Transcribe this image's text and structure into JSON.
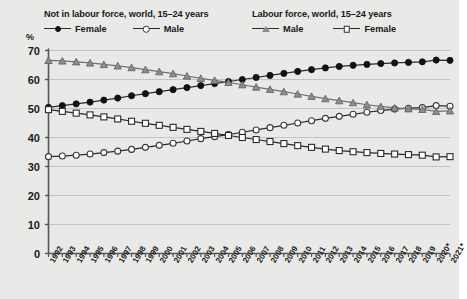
{
  "legend": {
    "left": {
      "title": "Not in labour force, world, 15–24 years",
      "entries": [
        {
          "label": "Female",
          "marker": "circle-filled"
        },
        {
          "label": "Male",
          "marker": "circle-open"
        }
      ]
    },
    "right": {
      "title": "Labour force, world, 15–24 years",
      "entries": [
        {
          "label": "Male",
          "marker": "triangle"
        },
        {
          "label": "Female",
          "marker": "square-open"
        }
      ]
    }
  },
  "axis": {
    "y_unit": "%",
    "y_ticks": [
      0,
      10,
      20,
      30,
      40,
      50,
      60,
      70
    ]
  },
  "chart_data": {
    "type": "line",
    "title": "",
    "xlabel": "",
    "ylabel": "%",
    "ylim": [
      0,
      70
    ],
    "grid": true,
    "legend_position": "top",
    "x": [
      "1992",
      "1993",
      "1994",
      "1995",
      "1996",
      "1997",
      "1998",
      "1999",
      "2000",
      "2001",
      "2002",
      "2003",
      "2004",
      "2005",
      "2006",
      "2007",
      "2008",
      "2009",
      "2010",
      "2011",
      "2012",
      "2013",
      "2014",
      "2015",
      "2016",
      "2017",
      "2018",
      "2019",
      "2020*",
      "2021*"
    ],
    "series": [
      {
        "name": "Female",
        "group": "Not in labour force, world, 15–24 years",
        "marker": "circle-filled",
        "color": "#111111",
        "values": [
          50.4,
          51.0,
          51.6,
          52.2,
          52.9,
          53.6,
          54.4,
          55.1,
          55.8,
          56.5,
          57.2,
          57.9,
          58.6,
          59.3,
          60.0,
          60.7,
          61.4,
          62.1,
          62.8,
          63.4,
          64.0,
          64.5,
          64.9,
          65.2,
          65.5,
          65.7,
          65.9,
          66.1,
          66.7,
          66.6
        ]
      },
      {
        "name": "Male",
        "group": "Not in labour force, world, 15–24 years",
        "marker": "circle-open",
        "color": "#3a3a3a",
        "values": [
          33.4,
          33.6,
          33.9,
          34.3,
          34.8,
          35.3,
          35.9,
          36.6,
          37.3,
          38.0,
          38.8,
          39.6,
          40.3,
          41.0,
          41.8,
          42.6,
          43.4,
          44.2,
          45.0,
          45.8,
          46.6,
          47.3,
          48.0,
          48.7,
          49.3,
          49.8,
          50.1,
          50.3,
          51.0,
          50.8
        ]
      },
      {
        "name": "Male",
        "group": "Labour force, world, 15–24 years",
        "marker": "triangle",
        "color": "#8d8d8d",
        "values": [
          66.6,
          66.4,
          66.1,
          65.7,
          65.2,
          64.7,
          64.1,
          63.4,
          62.7,
          62.0,
          61.2,
          60.4,
          59.7,
          59.0,
          58.2,
          57.4,
          56.6,
          55.8,
          55.0,
          54.2,
          53.4,
          52.7,
          52.0,
          51.3,
          50.7,
          50.2,
          49.9,
          49.7,
          49.0,
          49.2
        ]
      },
      {
        "name": "Female",
        "group": "Labour force, world, 15–24 years",
        "marker": "square-open",
        "color": "#2b2b2b",
        "values": [
          49.6,
          49.0,
          48.4,
          47.8,
          47.1,
          46.4,
          45.6,
          44.9,
          44.2,
          43.5,
          42.8,
          42.1,
          41.4,
          40.7,
          40.0,
          39.3,
          38.6,
          37.9,
          37.2,
          36.6,
          36.0,
          35.5,
          35.1,
          34.8,
          34.5,
          34.3,
          34.1,
          33.9,
          33.3,
          33.4
        ]
      }
    ]
  }
}
